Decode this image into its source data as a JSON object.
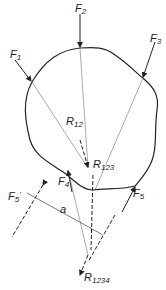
{
  "diagram": {
    "type": "force polygon / resultant of forces on rigid body",
    "forces": [
      {
        "id": "F1",
        "label": "F",
        "sub": "1"
      },
      {
        "id": "F2",
        "label": "F",
        "sub": "2"
      },
      {
        "id": "F3",
        "label": "F",
        "sub": "3"
      },
      {
        "id": "F4",
        "label": "F",
        "sub": "4"
      },
      {
        "id": "F5",
        "label": "F",
        "sub": "5"
      },
      {
        "id": "F5prime",
        "label": "F",
        "sub": "5",
        "prime": "'"
      }
    ],
    "resultants": [
      {
        "id": "R12",
        "label": "R",
        "sub": "12"
      },
      {
        "id": "R123",
        "label": "R",
        "sub": "123"
      },
      {
        "id": "R1234",
        "label": "R",
        "sub": "1234"
      }
    ],
    "dimension": {
      "label": "a"
    }
  }
}
